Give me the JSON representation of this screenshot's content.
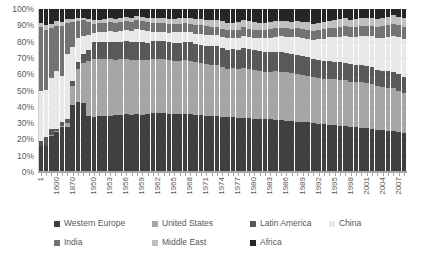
{
  "chart_data": {
    "type": "bar",
    "title": "",
    "subtitle": "",
    "xlabel": "",
    "ylabel": "",
    "stacked": true,
    "normalized_100_percent": true,
    "ylim": [
      0,
      100
    ],
    "grid": true,
    "legend_position": "bottom",
    "y_ticks": [
      "0%",
      "10%",
      "20%",
      "30%",
      "40%",
      "50%",
      "60%",
      "70%",
      "80%",
      "90%",
      "100%"
    ],
    "y_tick_values": [
      0,
      10,
      20,
      30,
      40,
      50,
      60,
      70,
      80,
      90,
      100
    ],
    "x_tick_labels": [
      "1",
      "1600",
      "1870",
      "1950",
      "1953",
      "1956",
      "1959",
      "1962",
      "1965",
      "1968",
      "1971",
      "1974",
      "1977",
      "1980",
      "1983",
      "1986",
      "1989",
      "1992",
      "1995",
      "1998",
      "2001",
      "2004",
      "2007"
    ],
    "categories": [
      "1",
      "1000",
      "1500",
      "1600",
      "1700",
      "1820",
      "1870",
      "1900",
      "1913",
      "1940",
      "1950",
      "1951",
      "1952",
      "1953",
      "1954",
      "1955",
      "1956",
      "1957",
      "1958",
      "1959",
      "1960",
      "1961",
      "1962",
      "1963",
      "1964",
      "1965",
      "1966",
      "1967",
      "1968",
      "1969",
      "1970",
      "1971",
      "1972",
      "1973",
      "1974",
      "1975",
      "1976",
      "1977",
      "1978",
      "1979",
      "1980",
      "1981",
      "1982",
      "1983",
      "1984",
      "1985",
      "1986",
      "1987",
      "1988",
      "1989",
      "1990",
      "1991",
      "1992",
      "1993",
      "1994",
      "1995",
      "1996",
      "1997",
      "1998",
      "1999",
      "2000",
      "2001",
      "2002",
      "2003",
      "2004",
      "2005",
      "2006",
      "2007",
      "2008"
    ],
    "series": [
      {
        "name": "Western Europe",
        "color": "#404040",
        "values": [
          13.0,
          12.0,
          17.8,
          19.8,
          21.9,
          23.0,
          33.0,
          33.5,
          33.0,
          26.0,
          26.2,
          26.5,
          26.4,
          26.6,
          26.8,
          27.0,
          27.2,
          27.1,
          27.0,
          27.1,
          27.3,
          27.4,
          27.5,
          27.4,
          27.5,
          27.3,
          27.2,
          27.0,
          26.9,
          26.9,
          26.8,
          26.6,
          26.5,
          26.4,
          26.2,
          25.8,
          25.7,
          25.5,
          25.3,
          25.1,
          24.9,
          24.6,
          24.4,
          24.2,
          24.0,
          23.8,
          23.6,
          23.4,
          23.2,
          23.0,
          22.8,
          22.5,
          22.3,
          22.0,
          21.8,
          21.6,
          21.4,
          21.2,
          21.0,
          20.8,
          20.6,
          20.4,
          20.2,
          20.0,
          19.8,
          19.6,
          19.4,
          19.2,
          19.0
        ]
      },
      {
        "name": "United States",
        "color": "#a6a6a6",
        "values": [
          0.3,
          0.3,
          0.5,
          0.5,
          0.6,
          2.0,
          9.0,
          15.8,
          19.0,
          26.0,
          27.3,
          27.0,
          26.8,
          26.9,
          26.3,
          26.5,
          26.3,
          26.0,
          25.4,
          25.8,
          25.5,
          25.2,
          25.4,
          25.3,
          25.2,
          25.3,
          25.3,
          25.0,
          25.0,
          24.9,
          24.6,
          24.3,
          24.2,
          24.1,
          23.5,
          22.9,
          23.1,
          23.2,
          23.2,
          23.0,
          22.5,
          22.5,
          21.8,
          22.0,
          22.4,
          22.4,
          22.2,
          22.0,
          22.0,
          21.8,
          21.6,
          21.1,
          21.1,
          21.0,
          21.2,
          21.0,
          20.9,
          21.0,
          21.2,
          21.3,
          21.4,
          21.0,
          20.8,
          20.6,
          20.4,
          20.3,
          20.1,
          19.8,
          19.2
        ]
      },
      {
        "name": "Latin America",
        "color": "#595959",
        "values": [
          2.2,
          3.9,
          2.9,
          1.1,
          1.7,
          2.1,
          2.5,
          3.5,
          4.4,
          5.0,
          7.8,
          7.9,
          8.0,
          8.0,
          8.1,
          8.1,
          8.2,
          8.2,
          8.3,
          8.3,
          8.3,
          8.4,
          8.4,
          8.4,
          8.5,
          8.5,
          8.6,
          8.6,
          8.6,
          8.7,
          8.7,
          8.8,
          8.9,
          9.0,
          9.1,
          9.0,
          9.1,
          9.1,
          9.2,
          9.2,
          9.3,
          9.3,
          9.2,
          9.0,
          8.9,
          8.9,
          8.8,
          8.7,
          8.6,
          8.5,
          8.4,
          8.3,
          8.3,
          8.3,
          8.3,
          8.2,
          8.2,
          8.2,
          8.1,
          8.0,
          8.0,
          7.9,
          7.8,
          7.7,
          7.7,
          7.7,
          7.7,
          7.7,
          7.7
        ]
      },
      {
        "name": "China",
        "color": "#e8e8e8",
        "values": [
          25.5,
          22.1,
          24.9,
          29.0,
          22.3,
          32.9,
          17.1,
          11.1,
          8.8,
          6.9,
          4.5,
          4.7,
          5.0,
          5.1,
          5.1,
          5.3,
          5.6,
          5.5,
          5.9,
          5.8,
          5.4,
          4.4,
          4.2,
          4.4,
          4.7,
          4.9,
          5.1,
          4.8,
          4.6,
          4.8,
          5.1,
          5.2,
          5.1,
          5.2,
          5.2,
          5.4,
          5.2,
          5.4,
          5.7,
          5.8,
          5.9,
          6.1,
          6.3,
          6.6,
          7.0,
          7.3,
          7.6,
          7.9,
          8.3,
          8.4,
          8.5,
          8.8,
          9.5,
          10.1,
          10.7,
          11.2,
          11.7,
          12.2,
          12.6,
          13.0,
          13.4,
          13.9,
          14.5,
          15.1,
          15.7,
          16.4,
          17.1,
          17.8,
          18.4
        ]
      },
      {
        "name": "India",
        "color": "#737373",
        "values": [
          32.0,
          28.0,
          24.4,
          22.4,
          24.4,
          16.0,
          12.1,
          8.6,
          7.5,
          6.0,
          4.2,
          4.1,
          4.2,
          4.3,
          4.3,
          4.3,
          4.2,
          4.2,
          4.3,
          4.2,
          4.3,
          4.2,
          4.1,
          4.0,
          4.1,
          3.9,
          3.8,
          3.9,
          4.0,
          4.0,
          4.1,
          4.0,
          3.9,
          3.9,
          3.8,
          3.9,
          3.8,
          3.9,
          4.0,
          3.8,
          3.7,
          3.8,
          3.8,
          3.9,
          3.9,
          3.9,
          4.0,
          4.0,
          4.1,
          4.1,
          4.2,
          4.1,
          4.2,
          4.2,
          4.3,
          4.4,
          4.5,
          4.5,
          4.6,
          4.7,
          4.8,
          4.9,
          5.0,
          5.1,
          5.3,
          5.5,
          5.7,
          5.9,
          6.1
        ]
      },
      {
        "name": "Middle East",
        "color": "#bfbfbf",
        "values": [
          2.0,
          2.3,
          2.2,
          2.1,
          2.0,
          1.7,
          1.5,
          1.3,
          1.2,
          1.4,
          1.7,
          1.8,
          1.8,
          1.8,
          1.9,
          1.9,
          1.9,
          2.0,
          2.0,
          2.1,
          2.2,
          2.3,
          2.3,
          2.4,
          2.5,
          2.6,
          2.6,
          2.7,
          2.8,
          2.9,
          3.0,
          3.1,
          3.2,
          3.3,
          3.4,
          3.4,
          3.5,
          3.6,
          3.5,
          3.6,
          3.6,
          3.4,
          3.3,
          3.2,
          3.2,
          3.1,
          3.2,
          3.2,
          3.2,
          3.3,
          3.4,
          3.4,
          3.4,
          3.4,
          3.4,
          3.5,
          3.5,
          3.6,
          3.6,
          3.6,
          3.7,
          3.7,
          3.8,
          3.8,
          3.9,
          3.9,
          4.0,
          4.0,
          4.1
        ]
      },
      {
        "name": "Africa",
        "color": "#262626",
        "values": [
          7.0,
          7.4,
          7.3,
          6.1,
          6.1,
          5.3,
          4.8,
          4.2,
          4.1,
          4.7,
          5.3,
          5.0,
          4.8,
          4.3,
          4.5,
          4.0,
          3.6,
          4.0,
          3.1,
          3.7,
          4.0,
          4.1,
          4.1,
          4.1,
          4.5,
          4.5,
          4.4,
          4.0,
          4.1,
          4.8,
          4.7,
          5.0,
          5.2,
          5.1,
          5.8,
          6.6,
          6.4,
          6.3,
          5.1,
          5.5,
          6.1,
          6.3,
          6.2,
          6.1,
          5.6,
          5.6,
          5.6,
          5.8,
          5.6,
          5.9,
          6.1,
          6.8,
          6.2,
          6.0,
          5.3,
          5.1,
          4.8,
          4.3,
          4.9,
          4.6,
          4.1,
          4.2,
          4.0,
          4.7,
          4.3,
          3.7,
          3.0,
          3.6,
          4.5
        ]
      }
    ],
    "legend": [
      {
        "label": "Western Europe",
        "color": "#404040"
      },
      {
        "label": "United States",
        "color": "#a6a6a6"
      },
      {
        "label": "Latin America",
        "color": "#595959"
      },
      {
        "label": "China",
        "color": "#e8e8e8"
      },
      {
        "label": "India",
        "color": "#737373"
      },
      {
        "label": "Middle East",
        "color": "#bfbfbf"
      },
      {
        "label": "Africa",
        "color": "#262626"
      }
    ]
  }
}
